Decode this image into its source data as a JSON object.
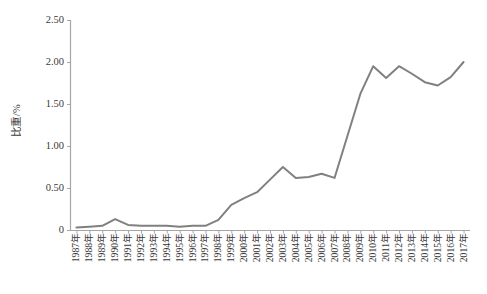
{
  "chart_data": {
    "type": "line",
    "title": "",
    "xlabel": "",
    "ylabel": "比重/%",
    "ylim": [
      0,
      2.5
    ],
    "y_ticks": [
      "0",
      "0.50",
      "1.00",
      "1.50",
      "2.00",
      "2.50"
    ],
    "y_tick_values": [
      0,
      0.5,
      1.0,
      1.5,
      2.0,
      2.5
    ],
    "grid": false,
    "legend": "none",
    "line_color": "#808080",
    "axis_color": "#a6a6a6",
    "categories": [
      "1987年",
      "1988年",
      "1989年",
      "1990年",
      "1991年",
      "1992年",
      "1993年",
      "1994年",
      "1995年",
      "1996年",
      "1997年",
      "1998年",
      "1999年",
      "2000年",
      "2001年",
      "2002年",
      "2003年",
      "2004年",
      "2005年",
      "2006年",
      "2007年",
      "2008年",
      "2009年",
      "2010年",
      "2011年",
      "2012年",
      "2013年",
      "2014年",
      "2015年",
      "2016年",
      "2017年"
    ],
    "x": [
      1987,
      1988,
      1989,
      1990,
      1991,
      1992,
      1993,
      1994,
      1995,
      1996,
      1997,
      1998,
      1999,
      2000,
      2001,
      2002,
      2003,
      2004,
      2005,
      2006,
      2007,
      2008,
      2009,
      2010,
      2011,
      2012,
      2013,
      2014,
      2015,
      2016,
      2017
    ],
    "values": [
      0.03,
      0.04,
      0.05,
      0.13,
      0.06,
      0.05,
      0.05,
      0.05,
      0.04,
      0.05,
      0.05,
      0.12,
      0.3,
      0.38,
      0.45,
      0.6,
      0.75,
      0.62,
      0.63,
      0.67,
      0.62,
      1.12,
      1.62,
      1.95,
      1.81,
      1.95,
      1.86,
      1.76,
      1.72,
      1.82,
      2.0
    ]
  }
}
